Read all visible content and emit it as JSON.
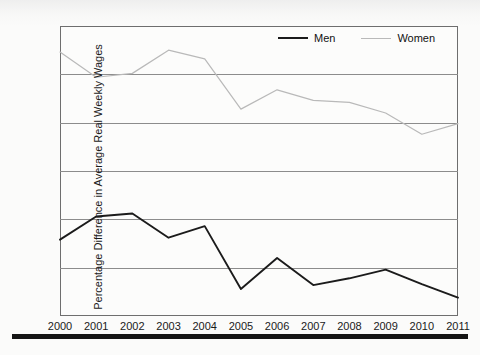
{
  "chart_data": {
    "type": "line",
    "title": "",
    "xlabel": "",
    "ylabel": "Percentage Difference in Average Real Weekly Wages",
    "x": [
      2000,
      2001,
      2002,
      2003,
      2004,
      2005,
      2006,
      2007,
      2008,
      2009,
      2010,
      2011
    ],
    "xticklabels": [
      "2000",
      "2001",
      "2002",
      "2003",
      "2004",
      "2005",
      "2006",
      "2007",
      "2008",
      "2009",
      "2010",
      "2011"
    ],
    "yticks": [
      35,
      40,
      45,
      50,
      55,
      60,
      65
    ],
    "yticklabels": [
      "35",
      "40",
      "45",
      "50",
      "55",
      "60",
      "65"
    ],
    "ylim": [
      35,
      65
    ],
    "grid": true,
    "legend_position": "top-right",
    "series": [
      {
        "name": "Men",
        "color": "#1b1b1b",
        "values": [
          42.9,
          45.3,
          45.6,
          43.1,
          44.3,
          37.8,
          41.0,
          38.2,
          38.9,
          39.8,
          38.3,
          36.9
        ]
      },
      {
        "name": "Women",
        "color": "#b9b9b9",
        "values": [
          62.3,
          59.7,
          60.1,
          62.5,
          61.6,
          56.4,
          58.4,
          57.3,
          57.1,
          56.0,
          53.8,
          54.9
        ]
      }
    ]
  },
  "legend": {
    "items": [
      {
        "label": "Men"
      },
      {
        "label": "Women"
      }
    ]
  },
  "colors": {
    "men_line": "#1b1b1b",
    "women_line": "#b9b9b9",
    "gridline": "#8c8c8c",
    "plot_border": "#6e6e6e",
    "text": "#1a1a1a",
    "paper": "#fbfbfa"
  }
}
